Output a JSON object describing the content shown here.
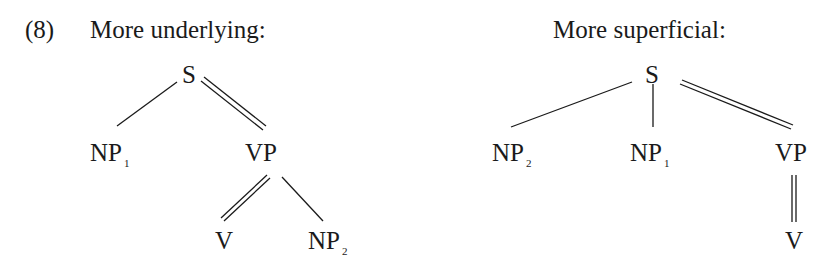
{
  "example": {
    "number": "(8)"
  },
  "trees": [
    {
      "heading": "More underlying:",
      "nodes": {
        "root": {
          "label": "S",
          "sub": ""
        },
        "np1": {
          "label": "NP",
          "sub": "1"
        },
        "vp": {
          "label": "VP",
          "sub": ""
        },
        "v": {
          "label": "V",
          "sub": ""
        },
        "np2": {
          "label": "NP",
          "sub": "2"
        }
      },
      "edges": [
        {
          "from": "S",
          "to": "NP1",
          "type": "single"
        },
        {
          "from": "S",
          "to": "VP",
          "type": "double"
        },
        {
          "from": "VP",
          "to": "V",
          "type": "double"
        },
        {
          "from": "VP",
          "to": "NP2",
          "type": "single"
        }
      ]
    },
    {
      "heading": "More superficial:",
      "nodes": {
        "root": {
          "label": "S",
          "sub": ""
        },
        "np2": {
          "label": "NP",
          "sub": "2"
        },
        "np1": {
          "label": "NP",
          "sub": "1"
        },
        "vp": {
          "label": "VP",
          "sub": ""
        },
        "v": {
          "label": "V",
          "sub": ""
        }
      },
      "edges": [
        {
          "from": "S",
          "to": "NP2",
          "type": "single"
        },
        {
          "from": "S",
          "to": "NP1",
          "type": "single"
        },
        {
          "from": "S",
          "to": "VP",
          "type": "double"
        },
        {
          "from": "VP",
          "to": "V",
          "type": "double"
        }
      ]
    }
  ],
  "colors": {
    "ink": "#1a1a1a",
    "background": "#ffffff"
  }
}
